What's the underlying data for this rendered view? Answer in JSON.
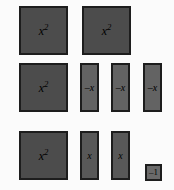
{
  "canvas": {
    "width": 174,
    "height": 190,
    "background": "#fbfbfb"
  },
  "legend": {
    "x_squared": "x",
    "x_squared_exponent": "2",
    "negative_x": "–x",
    "positive_x": "x",
    "negative_one": "–1"
  },
  "colors": {
    "x_squared_fill": "#4c4c4c",
    "negative_x_fill": "#636363",
    "x_fill": "#585858",
    "negative_one_fill": "#6a6a6a",
    "tile_border": "#1d1d1d",
    "label_text": "#000000"
  },
  "tiles": [
    {
      "id": "x2-tile-1",
      "name": "x-squared-tile",
      "kind": "x-squared",
      "label": "x",
      "exponent": "2",
      "x": 19,
      "y": 6,
      "width": 49,
      "height": 49
    },
    {
      "id": "x2-tile-2",
      "name": "x-squared-tile",
      "kind": "x-squared",
      "label": "x",
      "exponent": "2",
      "x": 82,
      "y": 6,
      "width": 49,
      "height": 49
    },
    {
      "id": "x2-tile-3",
      "name": "x-squared-tile",
      "kind": "x-squared",
      "label": "x",
      "exponent": "2",
      "x": 19,
      "y": 63,
      "width": 49,
      "height": 49
    },
    {
      "id": "negx-tile-1",
      "name": "negative-x-tile",
      "kind": "negative-x",
      "label": "–x",
      "exponent": "",
      "x": 80,
      "y": 63,
      "width": 19,
      "height": 49
    },
    {
      "id": "negx-tile-2",
      "name": "negative-x-tile",
      "kind": "negative-x",
      "label": "–x",
      "exponent": "",
      "x": 111,
      "y": 63,
      "width": 19,
      "height": 49
    },
    {
      "id": "negx-tile-3",
      "name": "negative-x-tile",
      "kind": "negative-x",
      "label": "–x",
      "exponent": "",
      "x": 143,
      "y": 63,
      "width": 19,
      "height": 49
    },
    {
      "id": "x2-tile-4",
      "name": "x-squared-tile",
      "kind": "x-squared",
      "label": "x",
      "exponent": "2",
      "x": 19,
      "y": 131,
      "width": 49,
      "height": 49
    },
    {
      "id": "x-tile-1",
      "name": "x-tile",
      "kind": "x",
      "label": "x",
      "exponent": "",
      "x": 80,
      "y": 131,
      "width": 19,
      "height": 49
    },
    {
      "id": "x-tile-2",
      "name": "x-tile",
      "kind": "x",
      "label": "x",
      "exponent": "",
      "x": 111,
      "y": 131,
      "width": 19,
      "height": 49
    },
    {
      "id": "neg1-tile-1",
      "name": "negative-one-tile",
      "kind": "negative-one",
      "label": "–1",
      "exponent": "",
      "x": 145,
      "y": 164,
      "width": 17,
      "height": 17
    }
  ]
}
